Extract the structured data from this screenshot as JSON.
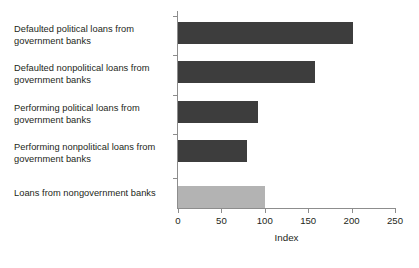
{
  "chart_data": {
    "type": "bar",
    "orientation": "horizontal",
    "title": "",
    "xlabel": "Index",
    "ylabel": "",
    "xlim": [
      0,
      250
    ],
    "xticks": [
      0,
      50,
      100,
      150,
      200,
      250
    ],
    "xtick_labels": [
      "0",
      "50",
      "100",
      "150",
      "200",
      "250"
    ],
    "grid": false,
    "legend": false,
    "categories": [
      "Defaulted political loans from government banks",
      "Defaulted nonpolitical loans from government banks",
      "Performing political loans from government banks",
      "Performing nonpolitical loans from government banks",
      "Loans from nongovernment banks"
    ],
    "values": [
      202,
      158,
      92,
      80,
      100
    ],
    "bar_colors": [
      "#3d3d3d",
      "#3d3d3d",
      "#3d3d3d",
      "#3d3d3d",
      "#b3b3b3"
    ],
    "colors": {
      "bar_dark": "#3d3d3d",
      "bar_light": "#b3b3b3",
      "axis": "#8d8d8d",
      "text": "#231f20",
      "background": "#ffffff"
    }
  },
  "labels": {
    "lines": [
      [
        "Defaulted political loans from",
        "government banks"
      ],
      [
        "Defaulted nonpolitical loans from",
        "government banks"
      ],
      [
        "Performing political loans from",
        "government banks"
      ],
      [
        "Performing nonpolitical loans from",
        "government banks"
      ],
      [
        "Loans from nongovernment banks"
      ]
    ]
  }
}
